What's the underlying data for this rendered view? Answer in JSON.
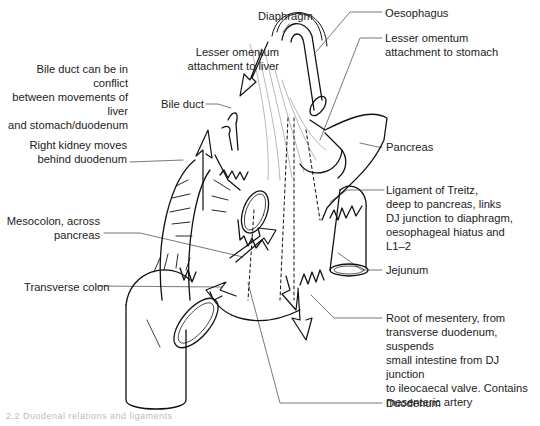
{
  "figure": {
    "type": "anatomical line drawing"
  },
  "labels": {
    "diaphragm": "Diaphragm",
    "oesophagus": "Oesophagus",
    "lesser_omentum_liver": "Lesser omentum\nattachment to liver",
    "lesser_omentum_stomach": "Lesser omentum\nattachment to stomach",
    "bile_duct_conflict": "Bile duct can be in conflict\nbetween movements of liver\nand stomach/duodenum",
    "bile_duct": "Bile duct",
    "right_kidney": "Right kidney moves\nbehind duodenum",
    "pancreas": "Pancreas",
    "ligament_treitz": "Ligament of Treitz,\ndeep to pancreas, links\nDJ junction to diaphragm,\noesophageal hiatus and\nL1–2",
    "mesocolon": "Mesocolon, across\npancreas",
    "jejunum": "Jejunum",
    "transverse_colon": "Transverse colon",
    "root_mesentery": "Root of mesentery, from\ntransverse duodenum, suspends\nsmall intestine from DJ junction\nto ileocaecal valve. Contains\nmesenteric artery",
    "duodenum": "Duodenum"
  },
  "caption": "2.2   Duodenal relations and ligaments"
}
